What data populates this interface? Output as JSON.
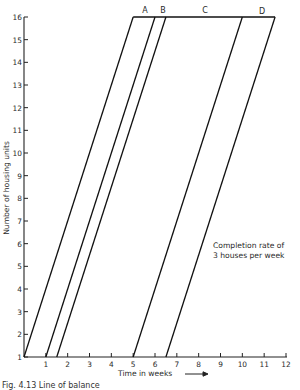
{
  "chart_data": {
    "type": "line",
    "title": "",
    "xlabel": "Time in weeks",
    "ylabel": "Number of housing units",
    "xlim": [
      0,
      12
    ],
    "ylim": [
      1,
      16
    ],
    "x_ticks": [
      1,
      2,
      3,
      4,
      5,
      6,
      7,
      8,
      9,
      10,
      11,
      12
    ],
    "y_ticks": [
      1,
      2,
      3,
      4,
      5,
      6,
      7,
      8,
      9,
      10,
      11,
      12,
      13,
      14,
      15,
      16
    ],
    "grid": false,
    "series": [
      {
        "name": "line-1",
        "x": [
          0,
          5
        ],
        "y": [
          1,
          16
        ]
      },
      {
        "name": "line-2",
        "x": [
          1,
          6
        ],
        "y": [
          1,
          16
        ]
      },
      {
        "name": "line-3",
        "x": [
          1.5,
          6.5
        ],
        "y": [
          1,
          16
        ]
      },
      {
        "name": "line-4",
        "x": [
          5,
          10
        ],
        "y": [
          1,
          16
        ]
      },
      {
        "name": "line-5",
        "x": [
          6.5,
          11.5
        ],
        "y": [
          1,
          16
        ]
      },
      {
        "name": "completion-line",
        "x": [
          5,
          11.5
        ],
        "y": [
          16,
          16
        ]
      }
    ],
    "segment_labels": [
      {
        "label": "A",
        "x": 5.5,
        "y": 16
      },
      {
        "label": "B",
        "x": 6.25,
        "y": 16
      },
      {
        "label": "C",
        "x": 8.25,
        "y": 16
      },
      {
        "label": "D",
        "x": 10.75,
        "y": 16
      }
    ],
    "annotations": [
      {
        "text": "Completion rate of",
        "x": 9.0,
        "y": 6.7
      },
      {
        "text": "3 houses per week",
        "x": 9.0,
        "y": 6.1
      }
    ]
  },
  "labels": {
    "xlabel": "Time in weeks",
    "ylabel": "Number of housing units",
    "annotation_line1": "Completion rate of",
    "annotation_line2": "3 houses per week",
    "seg_a": "A",
    "seg_b": "B",
    "seg_c": "C",
    "seg_d": "D",
    "caption": "Fig. 4.13 Line of balance"
  }
}
